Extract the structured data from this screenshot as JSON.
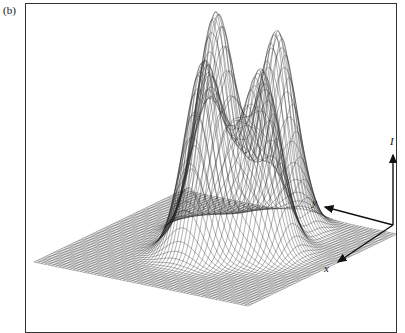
{
  "panel_label": "(b)",
  "figure": {
    "axes": {
      "vertical_label": "I",
      "y_label": "y",
      "x_label": "x"
    },
    "peaks": [
      {
        "name": "peak-left",
        "relative_height": 0.85
      },
      {
        "name": "peak-back",
        "relative_height": 1.0
      },
      {
        "name": "peak-front",
        "relative_height": 0.82
      },
      {
        "name": "peak-right",
        "relative_height": 0.9
      }
    ],
    "colors": {
      "line": "#222222",
      "frame": "#333333",
      "background": "#ffffff"
    }
  }
}
